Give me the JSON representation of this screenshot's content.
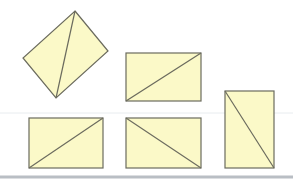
{
  "figure": {
    "width": 293,
    "height": 180,
    "background": "#ffffff",
    "fill_color": "#fbf9c8",
    "stroke_color": "#6b6b5e",
    "separator": {
      "y": 113,
      "x1": 0,
      "x2": 293,
      "color": "#e8ecef"
    },
    "bottom_bar": {
      "y": 177,
      "x1": 0,
      "x2": 293,
      "color": "#b9bec4"
    },
    "shapes": [
      {
        "id": "shape-1",
        "kind": "rotated-rectangle",
        "points": "75,11 108,51 56,98 23,58",
        "diagonal": {
          "x1": 75,
          "y1": 11,
          "x2": 56,
          "y2": 98
        }
      },
      {
        "id": "shape-2",
        "kind": "rectangle",
        "x": 126,
        "y": 53,
        "w": 75,
        "h": 48,
        "diagonal": {
          "x1": 126,
          "y1": 101,
          "x2": 201,
          "y2": 53
        }
      },
      {
        "id": "shape-3",
        "kind": "rectangle",
        "x": 29,
        "y": 118,
        "w": 74,
        "h": 50,
        "diagonal": {
          "x1": 29,
          "y1": 168,
          "x2": 103,
          "y2": 118
        }
      },
      {
        "id": "shape-4",
        "kind": "rectangle",
        "x": 126,
        "y": 118,
        "w": 75,
        "h": 50,
        "diagonal": {
          "x1": 126,
          "y1": 118,
          "x2": 201,
          "y2": 168
        }
      },
      {
        "id": "shape-5",
        "kind": "rectangle",
        "x": 225,
        "y": 91,
        "w": 49,
        "h": 77,
        "diagonal": {
          "x1": 225,
          "y1": 91,
          "x2": 274,
          "y2": 168
        }
      }
    ]
  }
}
